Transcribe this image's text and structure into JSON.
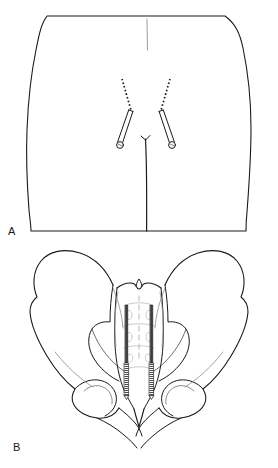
{
  "figure": {
    "type": "medical-line-illustration",
    "background_color": "#ffffff",
    "ink_color": "#1a1a1a",
    "faint_ink_color": "#9a9a9a",
    "width": 278,
    "height": 468,
    "panels": [
      {
        "id": "A",
        "label": "A",
        "caption": "",
        "subject": "posterior view of lower torso / buttocks with percutaneous iliosacral screw trajectories",
        "elements": [
          "torso-outline",
          "upper-midline-crease",
          "gluteal-cleft",
          "left-screw",
          "right-screw",
          "left-trajectory-dotted",
          "right-trajectory-dotted"
        ]
      },
      {
        "id": "B",
        "label": "B",
        "caption": "",
        "subject": "anteroposterior view of bony pelvis and sacrum with two iliosacral screws in situ",
        "elements": [
          "left-iliac-wing",
          "right-iliac-wing",
          "sacrum",
          "sacral-foramina",
          "coccyx",
          "left-acetabulum",
          "right-acetabulum",
          "left-pubic-ramus",
          "right-pubic-ramus",
          "left-sacral-screw",
          "right-sacral-screw"
        ]
      }
    ]
  },
  "labels": {
    "panel_a": "A",
    "panel_b": "B"
  }
}
